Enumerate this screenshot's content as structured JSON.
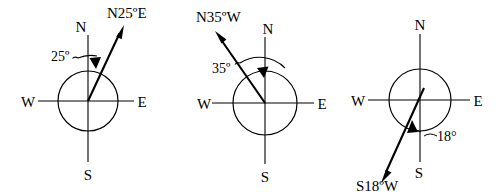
{
  "figure": {
    "background_color": "#ffffff",
    "stroke_color": "#000000"
  },
  "diagrams": [
    {
      "id": "compass-n25e",
      "bearing_label": "N25ºE",
      "angle_label": "25º",
      "angle_degrees": 25,
      "from_cardinal": "N",
      "toward_cardinal": "E",
      "cardinals": {
        "north": "N",
        "south": "S",
        "east": "E",
        "west": "W"
      }
    },
    {
      "id": "compass-n35w",
      "bearing_label": "N35ºW",
      "angle_label": "35º",
      "angle_degrees": 35,
      "from_cardinal": "N",
      "toward_cardinal": "W",
      "cardinals": {
        "north": "N",
        "south": "S",
        "east": "E",
        "west": "W"
      }
    },
    {
      "id": "compass-s18w",
      "bearing_label": "S18ºW",
      "angle_label": "18°",
      "angle_degrees": 18,
      "from_cardinal": "S",
      "toward_cardinal": "W",
      "cardinals": {
        "north": "N",
        "south": "S",
        "east": "E",
        "west": "W"
      }
    }
  ]
}
